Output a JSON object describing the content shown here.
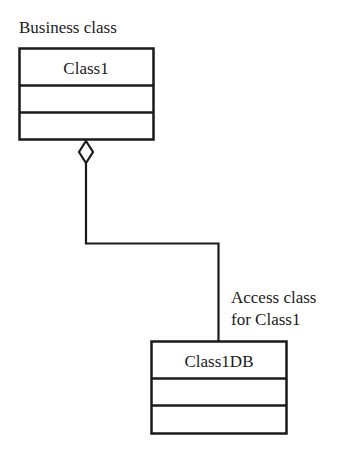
{
  "diagram": {
    "type": "UML class diagram",
    "colors": {
      "stroke": "#1a1a1a",
      "background": "#ffffff"
    },
    "classes": [
      {
        "name": "Class1",
        "stereotype_label": "Business class",
        "compartments": [
          "Class1",
          "",
          ""
        ]
      },
      {
        "name": "Class1DB",
        "stereotype_label_lines": [
          "Access class",
          "for Class1"
        ],
        "compartments": [
          "Class1DB",
          "",
          ""
        ]
      }
    ],
    "relationship": {
      "type": "aggregation",
      "whole": "Class1",
      "part": "Class1DB",
      "end_marker": "hollow-diamond"
    }
  }
}
